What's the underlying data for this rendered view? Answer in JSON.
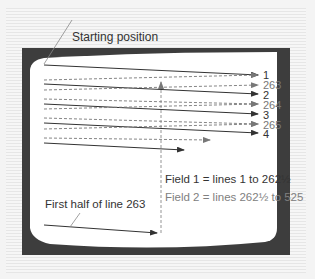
{
  "labels": {
    "starting_position": "Starting position",
    "first_half": "First half of line 263",
    "field1": "Field 1 = lines 1 to 262½",
    "field2": "Field 2 = lines 262½ to 525"
  },
  "line_numbers": [
    "1",
    "263",
    "2",
    "264",
    "3",
    "265",
    "4"
  ],
  "colors": {
    "frame": "#3d3d3d",
    "screen": "#ffffff",
    "solid_line": "#333333",
    "dashed_line": "#888888",
    "text_dark": "#333333",
    "text_light": "#808080"
  }
}
